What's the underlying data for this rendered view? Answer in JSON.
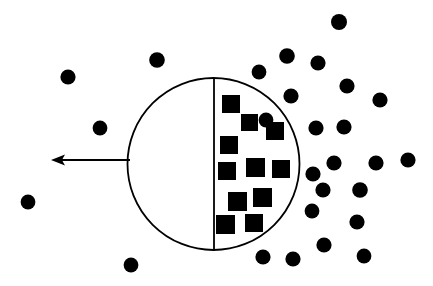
{
  "canvas": {
    "width": 433,
    "height": 286,
    "background": "#ffffff",
    "ink": "#000000"
  },
  "diagram": {
    "title": "",
    "boundary_circle": {
      "name": "boundary-circle",
      "cx": 213.5,
      "cy": 164,
      "r": 86,
      "stroke": "#000000",
      "stroke_width": 1.8,
      "fill": "none"
    },
    "divider_line": {
      "name": "vertical-diameter-line",
      "x1": 214,
      "y1": 78,
      "x2": 214,
      "y2": 250,
      "stroke": "#000000",
      "stroke_width": 1.8
    },
    "arrow": {
      "name": "leftward-arrow",
      "tail_x": 130,
      "tail_y": 160,
      "tip_x": 51,
      "tip_y": 160,
      "shaft_width": 2.2,
      "head_length": 14,
      "head_half_width": 5.5,
      "stroke": "#000000",
      "fill": "#000000"
    },
    "squares": {
      "name": "interior-squares",
      "fill": "#000000",
      "count": 11,
      "items": [
        {
          "x": 222,
          "y": 95,
          "size": 18
        },
        {
          "x": 241,
          "y": 114,
          "size": 17
        },
        {
          "x": 266,
          "y": 122,
          "size": 18
        },
        {
          "x": 220,
          "y": 136,
          "size": 18
        },
        {
          "x": 218,
          "y": 162,
          "size": 18
        },
        {
          "x": 246,
          "y": 158,
          "size": 19
        },
        {
          "x": 272,
          "y": 160,
          "size": 18
        },
        {
          "x": 228,
          "y": 192,
          "size": 19
        },
        {
          "x": 253,
          "y": 188,
          "size": 19
        },
        {
          "x": 216,
          "y": 215,
          "size": 19
        },
        {
          "x": 245,
          "y": 214,
          "size": 18
        }
      ]
    },
    "dots": {
      "name": "exterior-dots",
      "fill": "#000000",
      "radius": 7.6,
      "count": 27,
      "items": [
        {
          "cx": 157,
          "cy": 60,
          "r": 7.8
        },
        {
          "cx": 68,
          "cy": 77,
          "r": 7.6
        },
        {
          "cx": 100,
          "cy": 128,
          "r": 7.4
        },
        {
          "cx": 28,
          "cy": 202,
          "r": 7.4
        },
        {
          "cx": 131,
          "cy": 265,
          "r": 7.4
        },
        {
          "cx": 339,
          "cy": 22,
          "r": 8.0
        },
        {
          "cx": 287,
          "cy": 56,
          "r": 7.8
        },
        {
          "cx": 318,
          "cy": 63,
          "r": 7.6
        },
        {
          "cx": 259,
          "cy": 72,
          "r": 7.4
        },
        {
          "cx": 347,
          "cy": 86,
          "r": 7.6
        },
        {
          "cx": 291,
          "cy": 96,
          "r": 7.6
        },
        {
          "cx": 380,
          "cy": 100,
          "r": 7.6
        },
        {
          "cx": 316,
          "cy": 128,
          "r": 7.6
        },
        {
          "cx": 344,
          "cy": 127,
          "r": 7.6
        },
        {
          "cx": 313,
          "cy": 174,
          "r": 7.6
        },
        {
          "cx": 334,
          "cy": 163,
          "r": 7.6
        },
        {
          "cx": 266,
          "cy": 120,
          "r": 7.4
        },
        {
          "cx": 376,
          "cy": 163,
          "r": 7.6
        },
        {
          "cx": 408,
          "cy": 160,
          "r": 7.6
        },
        {
          "cx": 323,
          "cy": 190,
          "r": 7.6
        },
        {
          "cx": 360,
          "cy": 190,
          "r": 7.8
        },
        {
          "cx": 357,
          "cy": 222,
          "r": 7.6
        },
        {
          "cx": 324,
          "cy": 245,
          "r": 7.6
        },
        {
          "cx": 364,
          "cy": 256,
          "r": 7.4
        },
        {
          "cx": 293,
          "cy": 259,
          "r": 7.6
        },
        {
          "cx": 263,
          "cy": 257,
          "r": 7.6
        },
        {
          "cx": 312,
          "cy": 211,
          "r": 7.4
        }
      ]
    }
  }
}
